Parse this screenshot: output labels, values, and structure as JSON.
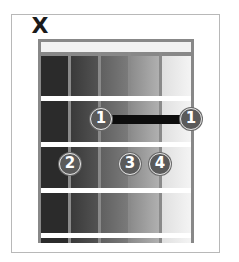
{
  "diagram": {
    "type": "guitar-chord-chart",
    "strings": 6,
    "frets_shown": 4,
    "muted_strings": [
      {
        "string_index": 0,
        "symbol": "X"
      }
    ],
    "column_shades": [
      "#2b2b2b",
      "#454545",
      "#6b6b6b",
      "#9a9a9a",
      "#c9c9c9",
      "#efefef"
    ],
    "barre": {
      "finger": "1",
      "fret": 1,
      "from_string_index": 2,
      "to_string_index": 5
    },
    "fingers": [
      {
        "label": "1",
        "string_index": 2,
        "fret": 1
      },
      {
        "label": "1",
        "string_index": 5,
        "fret": 1
      },
      {
        "label": "2",
        "string_index": 1,
        "fret": 2
      },
      {
        "label": "3",
        "string_index": 3,
        "fret": 2
      },
      {
        "label": "4",
        "string_index": 4,
        "fret": 2
      }
    ]
  }
}
